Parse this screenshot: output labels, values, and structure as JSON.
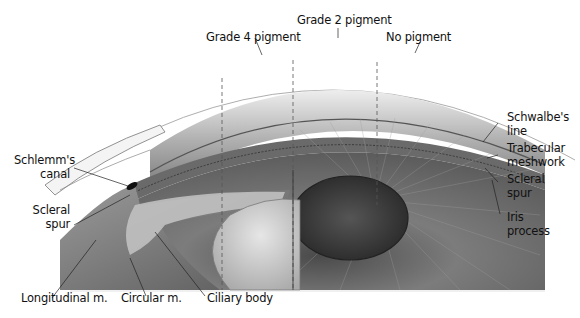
{
  "figure": {
    "colors": {
      "background": "#ffffff",
      "ink": "#111111",
      "iris": "#6e6e6e",
      "pupil": "#3a3a3a",
      "lens": "#c9c9c9"
    }
  },
  "labels": {
    "top": [
      {
        "text": "Grade 2 pigment"
      },
      {
        "text": "Grade 4 pigment"
      },
      {
        "text": "No pigment"
      }
    ],
    "right": [
      {
        "line1": "Schwalbe's",
        "line2": "line"
      },
      {
        "line1": "Trabecular",
        "line2": "meshwork"
      },
      {
        "line1": "Scleral",
        "line2": "spur"
      },
      {
        "line1": "Iris",
        "line2": "process"
      }
    ],
    "left": [
      {
        "line1": "Schlemm's",
        "line2": "canal"
      },
      {
        "line1": "Scleral",
        "line2": "spur"
      }
    ],
    "bottom": [
      {
        "text": "Longitudinal m."
      },
      {
        "text": "Circular m."
      },
      {
        "text": "Ciliary body"
      }
    ]
  }
}
